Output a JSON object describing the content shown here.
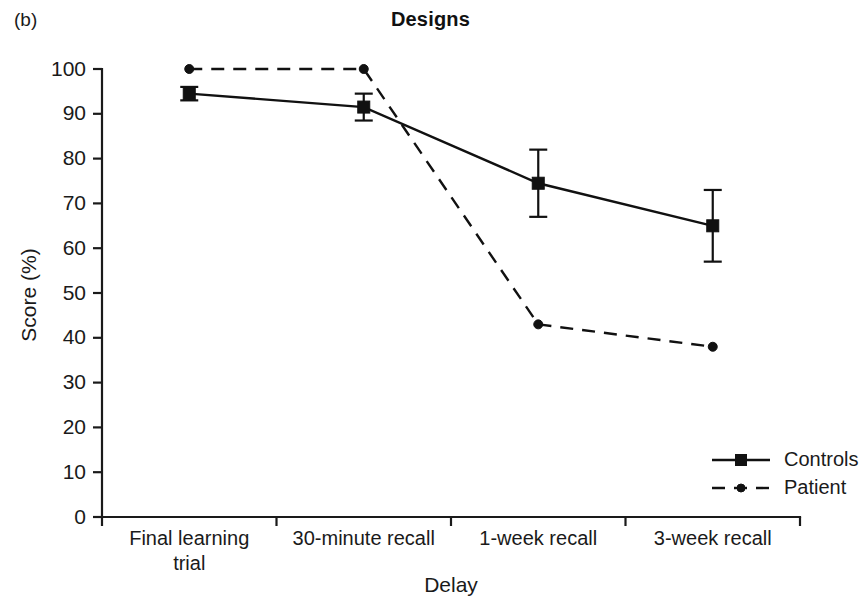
{
  "figure": {
    "panel_label": "(b)",
    "title": "Designs"
  },
  "chart_data": {
    "type": "line",
    "title": "Designs",
    "xlabel": "Delay",
    "ylabel": "Score (%)",
    "categories": [
      "Final learning trial",
      "30-minute recall",
      "1-week recall",
      "3-week recall"
    ],
    "category_lines": [
      [
        "Final learning",
        "trial"
      ],
      [
        "30-minute recall"
      ],
      [
        "1-week recall"
      ],
      [
        "3-week recall"
      ]
    ],
    "ylim": [
      0,
      100
    ],
    "yticks": [
      0,
      10,
      20,
      30,
      40,
      50,
      60,
      70,
      80,
      90,
      100
    ],
    "ytick_labels": [
      "0",
      "10",
      "20",
      "30",
      "40",
      "50",
      "60",
      "70",
      "80",
      "90",
      "100"
    ],
    "grid": false,
    "legend_position": "bottom-right",
    "series": [
      {
        "name": "Controls",
        "marker": "square",
        "linestyle": "solid",
        "color": "#111111",
        "values": [
          94.5,
          91.5,
          74.5,
          65.0
        ],
        "error_low": [
          93.0,
          88.5,
          67.0,
          57.0
        ],
        "error_high": [
          96.0,
          94.5,
          82.0,
          73.0
        ]
      },
      {
        "name": "Patient",
        "marker": "circle",
        "linestyle": "dashed",
        "color": "#111111",
        "values": [
          100.0,
          100.0,
          43.0,
          38.0
        ],
        "error_low": [
          null,
          null,
          null,
          null
        ],
        "error_high": [
          null,
          null,
          null,
          null
        ]
      }
    ]
  },
  "legend": {
    "items": [
      {
        "label": "Controls",
        "style": "solid-square"
      },
      {
        "label": "Patient",
        "style": "dashed-circle"
      }
    ]
  }
}
